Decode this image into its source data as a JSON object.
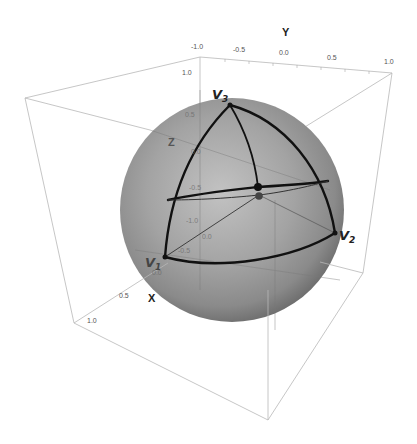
{
  "figure": {
    "type": "3d-sphere-plot"
  },
  "axes": {
    "x": {
      "label": "X",
      "ticks": [
        "0.0",
        "0.5",
        "1.0"
      ]
    },
    "y": {
      "label": "Y",
      "ticks": [
        "-1.0",
        "-0.5",
        "0.0",
        "0.5",
        "1.0"
      ]
    },
    "z": {
      "label": "Z",
      "ticks": [
        "1.0",
        "0.5",
        "0.0",
        "-0.5",
        "-1.0"
      ]
    },
    "inner_ticks": [
      "-0.5",
      "-1.0",
      "0.0",
      "-0.5",
      "0.0"
    ]
  },
  "vertices": [
    {
      "name": "V",
      "sub": "1"
    },
    {
      "name": "V",
      "sub": "2"
    },
    {
      "name": "V",
      "sub": "3"
    }
  ],
  "colors": {
    "sphere_fill": "#9a9a9a",
    "sphere_highlight": "#c4c4c4",
    "sphere_shadow": "#6e6e6e",
    "arc_stroke": "#111111",
    "box_stroke": "#b5b5b5",
    "background": "#ffffff"
  }
}
